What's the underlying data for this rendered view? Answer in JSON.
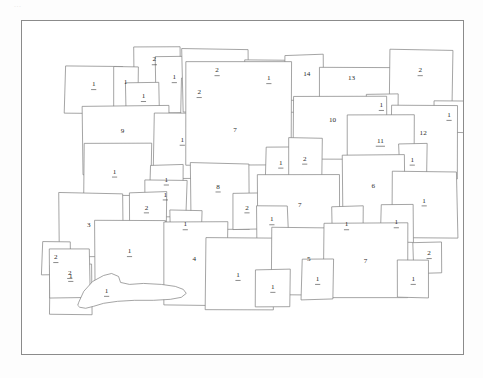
{
  "document": {
    "type": "scanned-parcel-plan",
    "corner_mark": "...",
    "frame": {
      "x": 21,
      "y": 20,
      "width": 443,
      "height": 335
    },
    "line_color": "#7d7d7d",
    "frame_color": "#8b8b8b",
    "label_color": "#2b2b2b",
    "background_color": "#ffffff"
  },
  "parcels": [
    {
      "id": "p01",
      "label": "1",
      "underline": true,
      "x": 43,
      "y": 46,
      "w": 58,
      "h": 47,
      "lx": 72,
      "ly": 64
    },
    {
      "id": "p02",
      "label": "2",
      "underline": true,
      "x": 113,
      "y": 26,
      "w": 46,
      "h": 49,
      "lx": 133,
      "ly": 39
    },
    {
      "id": "p03",
      "label": "1",
      "underline": false,
      "x": 92,
      "y": 46,
      "w": 25,
      "h": 45,
      "lx": 104,
      "ly": 62
    },
    {
      "id": "p04",
      "label": "1",
      "underline": true,
      "x": 134,
      "y": 36,
      "w": 38,
      "h": 56,
      "lx": 153,
      "ly": 57
    },
    {
      "id": "p05",
      "label": "1",
      "underline": true,
      "x": 104,
      "y": 62,
      "w": 34,
      "h": 34,
      "lx": 122,
      "ly": 76
    },
    {
      "id": "p06",
      "label": "2",
      "underline": true,
      "x": 160,
      "y": 58,
      "w": 37,
      "h": 35,
      "lx": 178,
      "ly": 72
    },
    {
      "id": "p07",
      "label": "2",
      "underline": true,
      "x": 161,
      "y": 28,
      "w": 66,
      "h": 63,
      "lx": 196,
      "ly": 50
    },
    {
      "id": "p08",
      "label": "1",
      "underline": true,
      "x": 224,
      "y": 39,
      "w": 54,
      "h": 52,
      "lx": 248,
      "ly": 58
    },
    {
      "id": "p09",
      "label": "14",
      "underline": false,
      "x": 264,
      "y": 34,
      "w": 38,
      "h": 45,
      "lx": 286,
      "ly": 54
    },
    {
      "id": "p10",
      "label": "13",
      "underline": false,
      "x": 298,
      "y": 46,
      "w": 73,
      "h": 39,
      "lx": 331,
      "ly": 58
    },
    {
      "id": "p11",
      "label": "2",
      "underline": true,
      "x": 369,
      "y": 29,
      "w": 63,
      "h": 60,
      "lx": 400,
      "ly": 50
    },
    {
      "id": "p12",
      "label": "9",
      "underline": false,
      "x": 61,
      "y": 85,
      "w": 86,
      "h": 70,
      "lx": 101,
      "ly": 111
    },
    {
      "id": "p13",
      "label": "1",
      "underline": true,
      "x": 132,
      "y": 92,
      "w": 63,
      "h": 66,
      "lx": 161,
      "ly": 120
    },
    {
      "id": "p14",
      "label": "7",
      "underline": false,
      "x": 164,
      "y": 41,
      "w": 106,
      "h": 104,
      "lx": 214,
      "ly": 110
    },
    {
      "id": "p15",
      "label": "1",
      "underline": true,
      "x": 346,
      "y": 73,
      "w": 32,
      "h": 27,
      "lx": 361,
      "ly": 85
    },
    {
      "id": "p16",
      "label": "10",
      "underline": false,
      "x": 272,
      "y": 76,
      "w": 94,
      "h": 63,
      "lx": 312,
      "ly": 100
    },
    {
      "id": "p17",
      "label": "1",
      "underline": true,
      "x": 414,
      "y": 80,
      "w": 30,
      "h": 32,
      "lx": 429,
      "ly": 95
    },
    {
      "id": "p18",
      "label": "12",
      "underline": false,
      "x": 371,
      "y": 85,
      "w": 66,
      "h": 74,
      "lx": 403,
      "ly": 113
    },
    {
      "id": "p19",
      "label": "11",
      "underline": true,
      "x": 327,
      "y": 94,
      "w": 67,
      "h": 45,
      "lx": 360,
      "ly": 121
    },
    {
      "id": "p20",
      "label": "1",
      "underline": true,
      "x": 62,
      "y": 123,
      "w": 68,
      "h": 53,
      "lx": 93,
      "ly": 152
    },
    {
      "id": "p21",
      "label": "1",
      "underline": true,
      "x": 129,
      "y": 145,
      "w": 33,
      "h": 33,
      "lx": 145,
      "ly": 160
    },
    {
      "id": "p22",
      "label": "1",
      "underline": true,
      "x": 245,
      "y": 127,
      "w": 32,
      "h": 35,
      "lx": 260,
      "ly": 143
    },
    {
      "id": "p23",
      "label": "2",
      "underline": true,
      "x": 268,
      "y": 118,
      "w": 34,
      "h": 45,
      "lx": 284,
      "ly": 139
    },
    {
      "id": "p24",
      "label": "1",
      "underline": true,
      "x": 379,
      "y": 124,
      "w": 28,
      "h": 34,
      "lx": 392,
      "ly": 140
    },
    {
      "id": "p25",
      "label": "6",
      "underline": false,
      "x": 322,
      "y": 135,
      "w": 63,
      "h": 70,
      "lx": 353,
      "ly": 166
    },
    {
      "id": "p26",
      "label": "1",
      "underline": true,
      "x": 372,
      "y": 152,
      "w": 65,
      "h": 66,
      "lx": 404,
      "ly": 181
    },
    {
      "id": "p27",
      "label": "8",
      "underline": true,
      "x": 170,
      "y": 143,
      "w": 58,
      "h": 67,
      "lx": 197,
      "ly": 167
    },
    {
      "id": "p28",
      "label": "1",
      "underline": true,
      "x": 124,
      "y": 160,
      "w": 41,
      "h": 37,
      "lx": 144,
      "ly": 175
    },
    {
      "id": "p29",
      "label": "2",
      "underline": true,
      "x": 108,
      "y": 172,
      "w": 37,
      "h": 40,
      "lx": 125,
      "ly": 188
    },
    {
      "id": "p30",
      "label": "2",
      "underline": true,
      "x": 211,
      "y": 173,
      "w": 33,
      "h": 36,
      "lx": 226,
      "ly": 188
    },
    {
      "id": "p31",
      "label": "7",
      "underline": false,
      "x": 236,
      "y": 155,
      "w": 83,
      "h": 58,
      "lx": 279,
      "ly": 185
    },
    {
      "id": "p32",
      "label": "1",
      "underline": true,
      "x": 236,
      "y": 186,
      "w": 31,
      "h": 33,
      "lx": 251,
      "ly": 200
    },
    {
      "id": "p33",
      "label": "3",
      "underline": false,
      "x": 37,
      "y": 173,
      "w": 64,
      "h": 64,
      "lx": 67,
      "ly": 206
    },
    {
      "id": "p34",
      "label": "1",
      "underline": true,
      "x": 149,
      "y": 190,
      "w": 31,
      "h": 31,
      "lx": 164,
      "ly": 205
    },
    {
      "id": "p35",
      "label": "1",
      "underline": true,
      "x": 311,
      "y": 186,
      "w": 31,
      "h": 38,
      "lx": 326,
      "ly": 205
    },
    {
      "id": "p36",
      "label": "1",
      "underline": true,
      "x": 360,
      "y": 184,
      "w": 33,
      "h": 38,
      "lx": 376,
      "ly": 203
    },
    {
      "id": "p37",
      "label": "2",
      "underline": true,
      "x": 20,
      "y": 222,
      "w": 28,
      "h": 33,
      "lx": 34,
      "ly": 238
    },
    {
      "id": "p38",
      "label": "1",
      "underline": true,
      "x": 73,
      "y": 200,
      "w": 71,
      "h": 70,
      "lx": 108,
      "ly": 232
    },
    {
      "id": "p39",
      "label": "4",
      "underline": false,
      "x": 142,
      "y": 202,
      "w": 64,
      "h": 84,
      "lx": 173,
      "ly": 240
    },
    {
      "id": "p40",
      "label": "1",
      "underline": true,
      "x": 28,
      "y": 245,
      "w": 42,
      "h": 50,
      "lx": 49,
      "ly": 257
    },
    {
      "id": "p41",
      "label": "1",
      "underline": true,
      "x": 184,
      "y": 218,
      "w": 68,
      "h": 73,
      "lx": 217,
      "ly": 256
    },
    {
      "id": "p42",
      "label": "5",
      "underline": false,
      "x": 251,
      "y": 208,
      "w": 84,
      "h": 68,
      "lx": 288,
      "ly": 240
    },
    {
      "id": "p43",
      "label": "1",
      "underline": true,
      "x": 235,
      "y": 250,
      "w": 34,
      "h": 38,
      "lx": 252,
      "ly": 268
    },
    {
      "id": "p44",
      "label": "7",
      "underline": false,
      "x": 303,
      "y": 203,
      "w": 85,
      "h": 76,
      "lx": 345,
      "ly": 242
    },
    {
      "id": "p45",
      "label": "1",
      "underline": true,
      "x": 281,
      "y": 240,
      "w": 32,
      "h": 40,
      "lx": 297,
      "ly": 260
    },
    {
      "id": "p46",
      "label": "2",
      "underline": true,
      "x": 393,
      "y": 223,
      "w": 29,
      "h": 31,
      "lx": 409,
      "ly": 234
    },
    {
      "id": "p47",
      "label": "1",
      "underline": true,
      "x": 377,
      "y": 241,
      "w": 32,
      "h": 37,
      "lx": 393,
      "ly": 260
    },
    {
      "id": "p48",
      "label": "2",
      "underline": true,
      "x": 28,
      "y": 230,
      "w": 40,
      "h": 48,
      "lx": 48,
      "ly": 254
    }
  ],
  "irregular_shape": {
    "id": "blob-1",
    "label": "1",
    "underline": true,
    "label_x": 85,
    "label_y": 272,
    "points": "57,283 62,272 71,262 82,256 90,254 97,257 99,263 108,265 122,264 140,265 154,267 162,270 165,274 160,278 149,280 132,281 113,281 96,282 82,284 72,287 64,289 58,288 56,286"
  }
}
